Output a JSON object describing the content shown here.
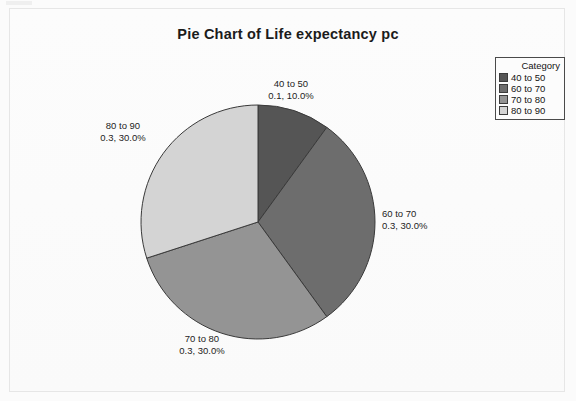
{
  "chart_data": {
    "type": "pie",
    "title": "Pie Chart of Life expectancy pc",
    "legend_title": "Category",
    "legend_position": "top-right",
    "start_angle_deg": 0,
    "direction": "clockwise",
    "categories": [
      "40 to 50",
      "60 to 70",
      "70 to 80",
      "80 to 90"
    ],
    "values": [
      0.1,
      0.3,
      0.3,
      0.3
    ],
    "percents": [
      "10.0%",
      "30.0%",
      "30.0%",
      "30.0%"
    ],
    "colors": [
      "#555555",
      "#6d6d6d",
      "#949494",
      "#d4d4d4"
    ],
    "slices": [
      {
        "label": "40 to 50",
        "value_text": "0.1, 10.0%",
        "value": 0.1,
        "percent": 10.0,
        "color": "#555555",
        "label_x": 291,
        "label_y": 78,
        "align": "center"
      },
      {
        "label": "60 to 70",
        "value_text": "0.3, 30.0%",
        "value": 0.3,
        "percent": 30.0,
        "color": "#6d6d6d",
        "label_x": 382,
        "label_y": 208,
        "align": "left"
      },
      {
        "label": "70 to 80",
        "value_text": "0.3, 30.0%",
        "value": 0.3,
        "percent": 30.0,
        "color": "#949494",
        "label_x": 202,
        "label_y": 333,
        "align": "center"
      },
      {
        "label": "80 to 90",
        "value_text": "0.3, 30.0%",
        "value": 0.3,
        "percent": 30.0,
        "color": "#d4d4d4",
        "label_x": 123,
        "label_y": 120,
        "align": "center"
      }
    ],
    "xlabel": "",
    "ylabel": "",
    "grid": false
  },
  "legend": {
    "title": "Category",
    "items": [
      {
        "label": "40 to 50",
        "color": "#555555"
      },
      {
        "label": "60 to 70",
        "color": "#6d6d6d"
      },
      {
        "label": "70 to 80",
        "color": "#949494"
      },
      {
        "label": "80 to 90",
        "color": "#d4d4d4"
      }
    ]
  }
}
